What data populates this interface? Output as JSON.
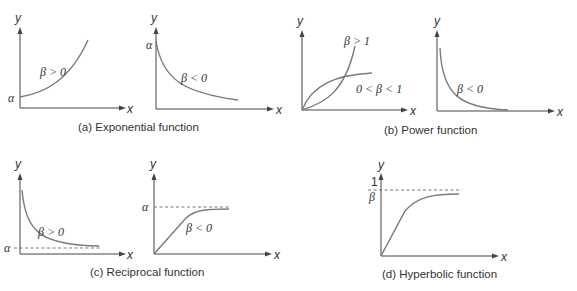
{
  "figure": {
    "panels": [
      {
        "id": "a",
        "caption": "(a) Exponential function",
        "subplots": [
          {
            "y_label": "y",
            "x_label": "x",
            "intercept_label": "α",
            "curve_label": "β > 0",
            "shape": "increasing convex from α"
          },
          {
            "y_label": "y",
            "x_label": "x",
            "intercept_label": "α",
            "curve_label": "β < 0",
            "shape": "decreasing convex from α"
          }
        ]
      },
      {
        "id": "b",
        "caption": "(b) Power function",
        "subplots": [
          {
            "y_label": "y",
            "x_label": "x",
            "curve_labels": [
              "β > 1",
              "0 < β < 1"
            ],
            "shape": "two curves through origin"
          },
          {
            "y_label": "y",
            "x_label": "x",
            "curve_label": "β < 0",
            "shape": "decreasing hyperbola"
          }
        ]
      },
      {
        "id": "c",
        "caption": "(c) Reciprocal function",
        "subplots": [
          {
            "y_label": "y",
            "x_label": "x",
            "asymptote_label": "α",
            "curve_label": "β > 0",
            "shape": "decreasing to asymptote α"
          },
          {
            "y_label": "y",
            "x_label": "x",
            "asymptote_label": "α",
            "curve_label": "β < 0",
            "shape": "increasing to asymptote α"
          }
        ]
      },
      {
        "id": "d",
        "caption": "(d) Hyperbolic function",
        "subplots": [
          {
            "y_label": "y",
            "x_label": "x",
            "asymptote_label_num": "1",
            "asymptote_label_den": "β",
            "shape": "increasing to asymptote 1/β"
          }
        ]
      }
    ]
  },
  "colors": {
    "curve": "#7a7a7a",
    "axis": "#444444",
    "text": "#333333"
  }
}
